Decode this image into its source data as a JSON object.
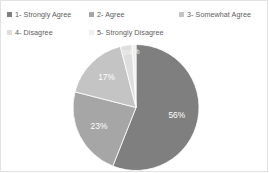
{
  "legend": {
    "items": [
      {
        "label": "1- Strongly Agree",
        "color": "#7f7f7f"
      },
      {
        "label": "2- Agree",
        "color": "#a6a6a6"
      },
      {
        "label": "3- Somewhat Agree",
        "color": "#c4c4c4"
      },
      {
        "label": "4- Disagree",
        "color": "#dedede"
      },
      {
        "label": "5- Strongly Disagree",
        "color": "#efefef"
      }
    ]
  },
  "chart_data": {
    "type": "pie",
    "title": "",
    "categories": [
      "1- Strongly Agree",
      "2- Agree",
      "3- Somewhat Agree",
      "4- Disagree",
      "5- Strongly Disagree"
    ],
    "values": [
      56,
      23,
      17,
      3,
      1
    ],
    "labels": [
      "56%",
      "23%",
      "17%",
      "3%",
      "1%"
    ],
    "colors": [
      "#7f7f7f",
      "#a6a6a6",
      "#c4c4c4",
      "#dedede",
      "#efefef"
    ],
    "legend_position": "top",
    "grid": false,
    "xlabel": "",
    "ylabel": ""
  }
}
